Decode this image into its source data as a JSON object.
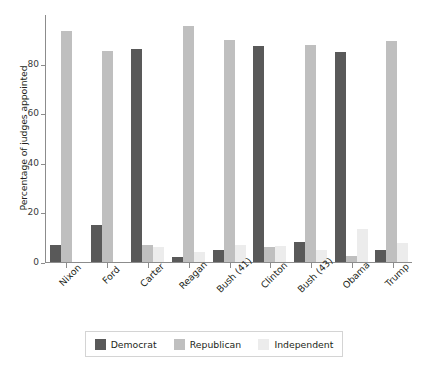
{
  "chart_data": {
    "type": "bar",
    "title": "",
    "xlabel": "",
    "ylabel": "Percentage of judges appointed",
    "ylim": [
      0,
      100
    ],
    "yticks": [
      0,
      20,
      40,
      60,
      80
    ],
    "grid": false,
    "legend_position": "bottom",
    "categories": [
      "Nixon",
      "Ford",
      "Carter",
      "Reagan",
      "Bush (41)",
      "Clinton",
      "Bush (43)",
      "Obama",
      "Trump"
    ],
    "series": [
      {
        "name": "Democrat",
        "color": "#595959",
        "values": [
          7,
          15,
          86,
          2,
          5,
          87,
          8,
          84.5,
          5
        ]
      },
      {
        "name": "Republican",
        "color": "#bfbfbf",
        "values": [
          93,
          85,
          7,
          95,
          89.5,
          6,
          87.5,
          2.5,
          89
        ]
      },
      {
        "name": "Independent",
        "color": "#ececec",
        "values": [
          0,
          0,
          6,
          4,
          7,
          6.5,
          5,
          13.5,
          7.5
        ]
      }
    ]
  },
  "legend": {
    "items": [
      {
        "label": "Democrat"
      },
      {
        "label": "Republican"
      },
      {
        "label": "Independent"
      }
    ]
  }
}
